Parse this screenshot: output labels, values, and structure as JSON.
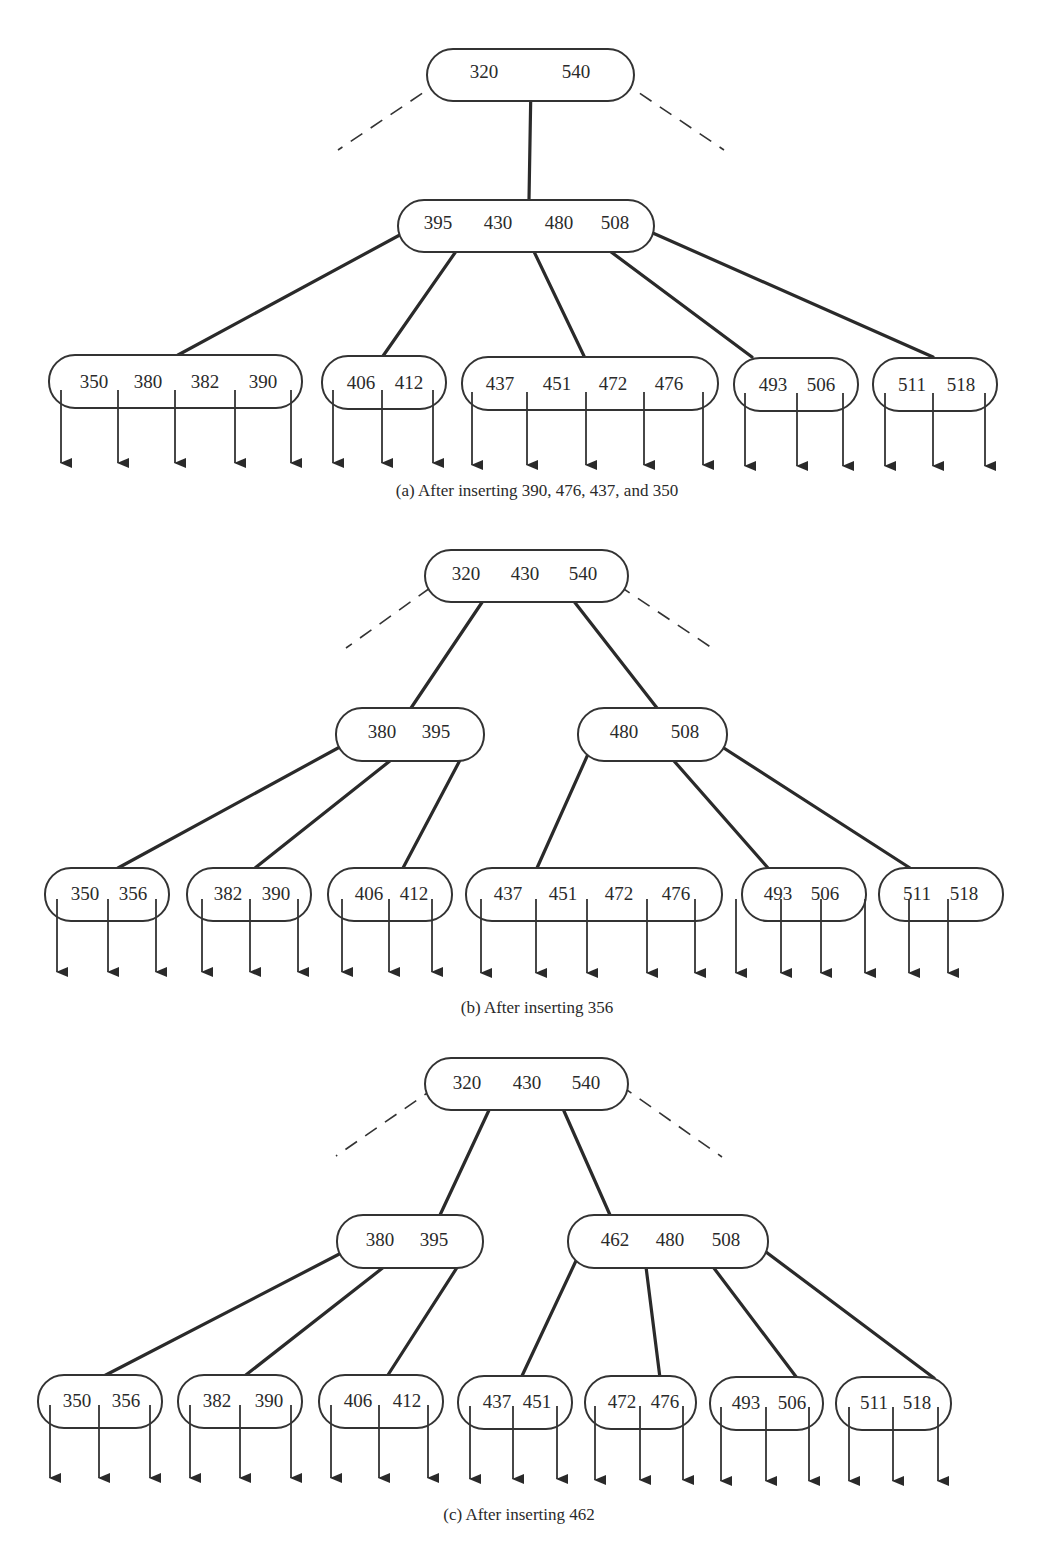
{
  "figures": [
    {
      "id": "a",
      "caption": "(a)  After inserting 390, 476, 437, and 350",
      "root": {
        "keys": [
          "320",
          "540"
        ]
      },
      "internal": [
        {
          "keys": [
            "395",
            "430",
            "480",
            "508"
          ]
        }
      ],
      "leaves": [
        {
          "keys": [
            "350",
            "380",
            "382",
            "390"
          ]
        },
        {
          "keys": [
            "406",
            "412"
          ]
        },
        {
          "keys": [
            "437",
            "451",
            "472",
            "476"
          ]
        },
        {
          "keys": [
            "493",
            "506"
          ]
        },
        {
          "keys": [
            "511",
            "518"
          ]
        }
      ]
    },
    {
      "id": "b",
      "caption": "(b)  After inserting 356",
      "root": {
        "keys": [
          "320",
          "430",
          "540"
        ]
      },
      "internal": [
        {
          "keys": [
            "380",
            "395"
          ]
        },
        {
          "keys": [
            "480",
            "508"
          ]
        }
      ],
      "leaves": [
        {
          "keys": [
            "350",
            "356"
          ]
        },
        {
          "keys": [
            "382",
            "390"
          ]
        },
        {
          "keys": [
            "406",
            "412"
          ]
        },
        {
          "keys": [
            "437",
            "451",
            "472",
            "476"
          ]
        },
        {
          "keys": [
            "493",
            "506"
          ]
        },
        {
          "keys": [
            "511",
            "518"
          ]
        }
      ]
    },
    {
      "id": "c",
      "caption": "(c)  After inserting 462",
      "root": {
        "keys": [
          "320",
          "430",
          "540"
        ]
      },
      "internal": [
        {
          "keys": [
            "380",
            "395"
          ]
        },
        {
          "keys": [
            "462",
            "480",
            "508"
          ]
        }
      ],
      "leaves": [
        {
          "keys": [
            "350",
            "356"
          ]
        },
        {
          "keys": [
            "382",
            "390"
          ]
        },
        {
          "keys": [
            "406",
            "412"
          ]
        },
        {
          "keys": [
            "437",
            "451"
          ]
        },
        {
          "keys": [
            "472",
            "476"
          ]
        },
        {
          "keys": [
            "493",
            "506"
          ]
        },
        {
          "keys": [
            "511",
            "518"
          ]
        }
      ]
    }
  ]
}
